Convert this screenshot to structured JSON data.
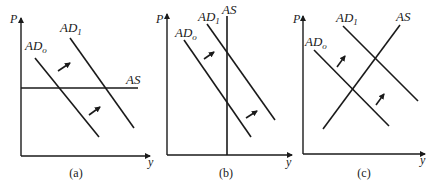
{
  "figure": {
    "panels": [
      {
        "caption": "(a)",
        "y_axis_label": "P",
        "x_axis_label": "y",
        "as_label": "AS",
        "as_shape": "horizontal",
        "ad0_label": "AD",
        "ad0_sub": "o",
        "ad1_label": "AD",
        "ad1_sub": "1",
        "shift_arrows": 2
      },
      {
        "caption": "(b)",
        "y_axis_label": "P",
        "x_axis_label": "y",
        "as_label": "AS",
        "as_shape": "vertical",
        "ad0_label": "AD",
        "ad0_sub": "o",
        "ad1_label": "AD",
        "ad1_sub": "1",
        "shift_arrows": 2
      },
      {
        "caption": "(c)",
        "y_axis_label": "P",
        "x_axis_label": "y",
        "as_label": "AS",
        "as_shape": "upward-sloping",
        "ad0_label": "AD",
        "ad0_sub": "o",
        "ad1_label": "AD",
        "ad1_sub": "1",
        "shift_arrows": 2
      }
    ],
    "colors": {
      "ink": "#1a1a1a",
      "background": "#ffffff"
    }
  }
}
